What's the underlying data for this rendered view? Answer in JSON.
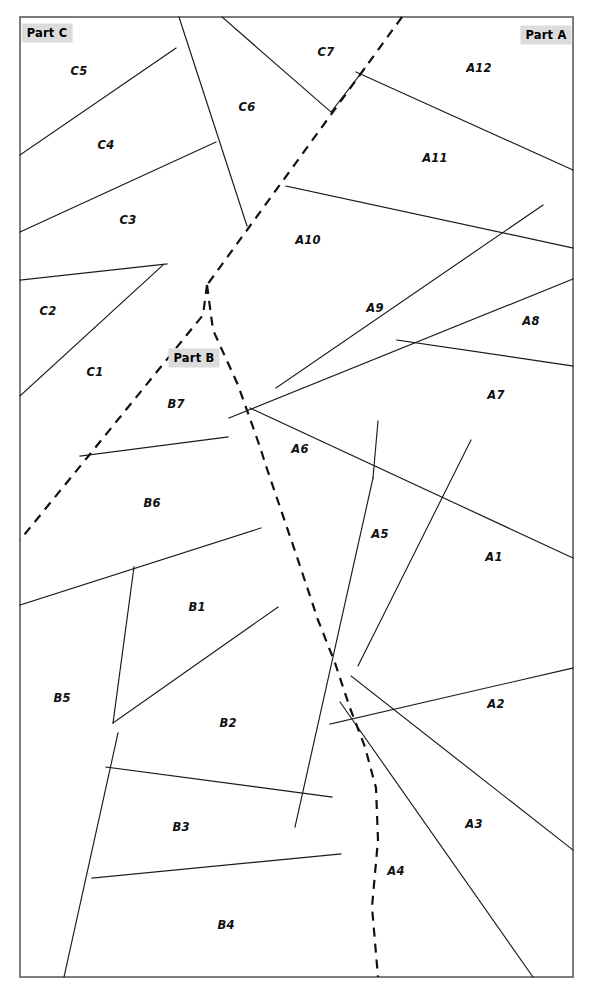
{
  "figure": {
    "kind": "partition-diagram",
    "width": 594,
    "height": 994,
    "background_color": "#ffffff",
    "frame": {
      "x": 20,
      "y": 17,
      "width": 553,
      "height": 960,
      "stroke_color": "#7d7d7d",
      "stroke_width": 2
    },
    "line_styles": {
      "interior_solid_color": "#1a1a1a",
      "interior_solid_width": 1.15,
      "part_boundary_color": "#111111",
      "part_boundary_width": 2.2,
      "part_boundary_dash": "9 7"
    },
    "part_label_style": {
      "background_color": "#dcdcdc",
      "text_color": "#000000"
    }
  },
  "parts": [
    {
      "id": "part-c",
      "label": "Part C",
      "x": 47,
      "y": 33
    },
    {
      "id": "part-a",
      "label": "Part A",
      "x": 546,
      "y": 35
    },
    {
      "id": "part-b",
      "label": "Part B",
      "x": 194,
      "y": 358
    }
  ],
  "cells": [
    {
      "id": "A1",
      "label": "A1",
      "x": 494,
      "y": 557,
      "part": "Part A"
    },
    {
      "id": "A2",
      "label": "A2",
      "x": 496,
      "y": 704,
      "part": "Part A"
    },
    {
      "id": "A3",
      "label": "A3",
      "x": 474,
      "y": 824,
      "part": "Part A"
    },
    {
      "id": "A4",
      "label": "A4",
      "x": 396,
      "y": 871,
      "part": "Part A"
    },
    {
      "id": "A5",
      "label": "A5",
      "x": 380,
      "y": 534,
      "part": "Part A"
    },
    {
      "id": "A6",
      "label": "A6",
      "x": 300,
      "y": 449,
      "part": "Part A"
    },
    {
      "id": "A7",
      "label": "A7",
      "x": 496,
      "y": 395,
      "part": "Part A"
    },
    {
      "id": "A8",
      "label": "A8",
      "x": 531,
      "y": 321,
      "part": "Part A"
    },
    {
      "id": "A9",
      "label": "A9",
      "x": 375,
      "y": 308,
      "part": "Part A"
    },
    {
      "id": "A10",
      "label": "A10",
      "x": 308,
      "y": 240,
      "part": "Part A"
    },
    {
      "id": "A11",
      "label": "A11",
      "x": 435,
      "y": 158,
      "part": "Part A"
    },
    {
      "id": "A12",
      "label": "A12",
      "x": 479,
      "y": 68,
      "part": "Part A"
    },
    {
      "id": "B1",
      "label": "B1",
      "x": 197,
      "y": 607,
      "part": "Part B"
    },
    {
      "id": "B2",
      "label": "B2",
      "x": 228,
      "y": 723,
      "part": "Part B"
    },
    {
      "id": "B3",
      "label": "B3",
      "x": 181,
      "y": 827,
      "part": "Part B"
    },
    {
      "id": "B4",
      "label": "B4",
      "x": 226,
      "y": 925,
      "part": "Part B"
    },
    {
      "id": "B5",
      "label": "B5",
      "x": 62,
      "y": 698,
      "part": "Part B"
    },
    {
      "id": "B6",
      "label": "B6",
      "x": 152,
      "y": 503,
      "part": "Part B"
    },
    {
      "id": "B7",
      "label": "B7",
      "x": 176,
      "y": 404,
      "part": "Part B"
    },
    {
      "id": "C1",
      "label": "C1",
      "x": 95,
      "y": 372,
      "part": "Part C"
    },
    {
      "id": "C2",
      "label": "C2",
      "x": 48,
      "y": 311,
      "part": "Part C"
    },
    {
      "id": "C3",
      "label": "C3",
      "x": 128,
      "y": 220,
      "part": "Part C"
    },
    {
      "id": "C4",
      "label": "C4",
      "x": 106,
      "y": 145,
      "part": "Part C"
    },
    {
      "id": "C5",
      "label": "C5",
      "x": 79,
      "y": 71,
      "part": "Part C"
    },
    {
      "id": "C6",
      "label": "C6",
      "x": 247,
      "y": 107,
      "part": "Part C"
    },
    {
      "id": "C7",
      "label": "C7",
      "x": 326,
      "y": 52,
      "part": "Part C"
    }
  ],
  "part_boundaries": [
    {
      "id": "boundary-c-a",
      "from_part": "Part C",
      "to_part": "Part A",
      "points": "402,17 207,285"
    },
    {
      "id": "boundary-c-b",
      "from_part": "Part C",
      "to_part": "Part B",
      "points": "207,285 203,315 86,459 20,540"
    },
    {
      "id": "boundary-b-a",
      "from_part": "Part B",
      "to_part": "Part A",
      "points": "207,285 213,330 238,385 260,447 266,466 296,554 318,620 335,663 350,708 365,747 376,788 378,840 372,907 378,977"
    }
  ],
  "interior_lines": [
    {
      "id": "line-c5-c4",
      "points": "20,155 176,48"
    },
    {
      "id": "line-c4-c3",
      "points": "20,232 216,142"
    },
    {
      "id": "line-c3-c2",
      "points": "20,280 167,264"
    },
    {
      "id": "line-c2-c1",
      "points": "20,396 163,265"
    },
    {
      "id": "line-c6-top",
      "points": "179,17 247,226"
    },
    {
      "id": "line-c6-c7",
      "points": "222,17 331,112"
    },
    {
      "id": "line-c7-a",
      "points": "331,112 365,68"
    },
    {
      "id": "line-b7-b6",
      "points": "80,456 228,437"
    },
    {
      "id": "line-b6-b1",
      "points": "20,605 261,528"
    },
    {
      "id": "line-b1-b5",
      "points": "134,567 113,723"
    },
    {
      "id": "line-b1-b2",
      "points": "113,723 278,607"
    },
    {
      "id": "line-b2-b3",
      "points": "106,767 332,797"
    },
    {
      "id": "line-b3-b4",
      "points": "92,878 341,854"
    },
    {
      "id": "line-b5-bottom",
      "points": "118,733 64,977"
    },
    {
      "id": "line-a10-a9",
      "points": "276,388 543,205"
    },
    {
      "id": "line-a9-a8",
      "points": "229,418 573,279"
    },
    {
      "id": "line-a8-a7",
      "points": "397,340 573,366"
    },
    {
      "id": "line-a6-a7",
      "points": "250,408 573,558"
    },
    {
      "id": "line-a6-a5",
      "points": "378,421 373,478"
    },
    {
      "id": "line-a5-left",
      "points": "373,478 295,827"
    },
    {
      "id": "line-a5-a1",
      "points": "471,440 358,666"
    },
    {
      "id": "line-a1-a2",
      "points": "330,724 573,668"
    },
    {
      "id": "line-a2-a3",
      "points": "351,676 573,850"
    },
    {
      "id": "line-a3-a4",
      "points": "340,702 533,977"
    },
    {
      "id": "line-a11-a12",
      "points": "356,72 573,170"
    },
    {
      "id": "line-a11-a10",
      "points": "286,186 573,248"
    }
  ]
}
